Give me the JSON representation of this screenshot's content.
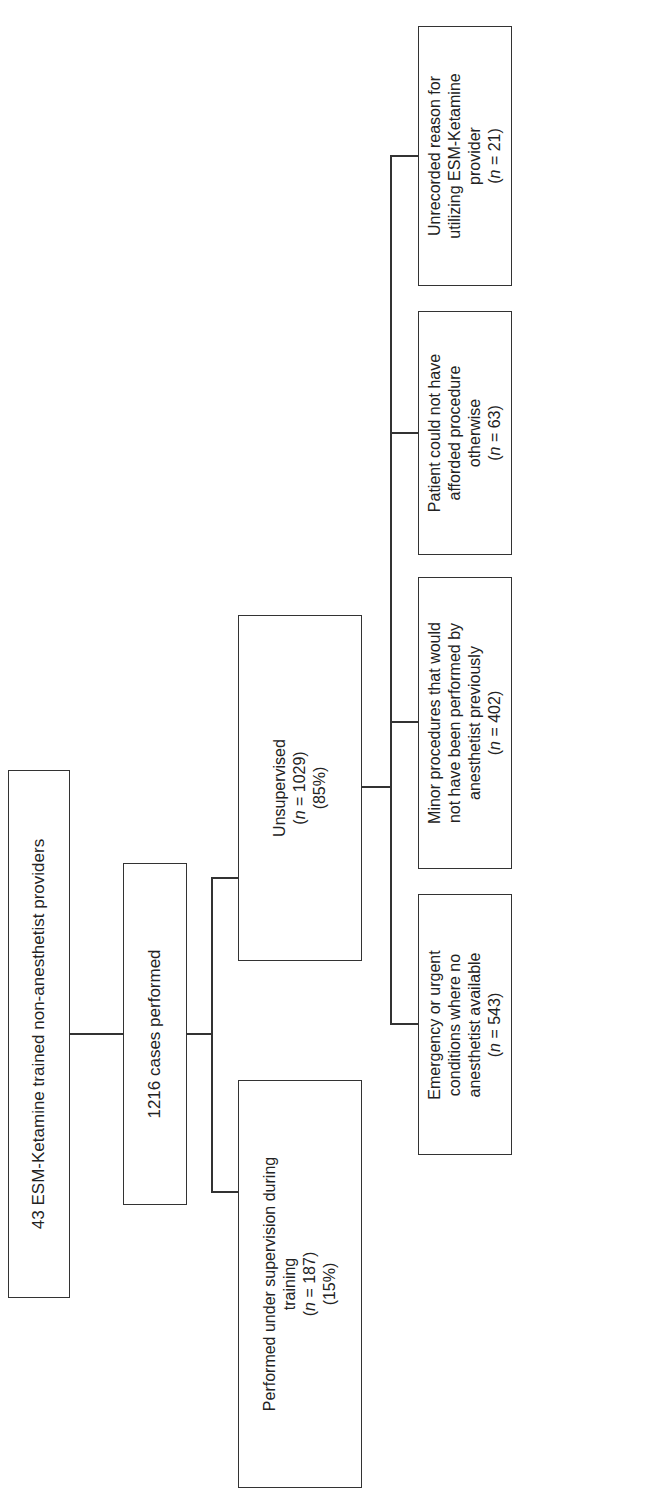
{
  "diagram": {
    "type": "flowchart",
    "orientation": "rotated-90-ccw",
    "root": {
      "label": "43 ESM-Ketamine trained non-anesthetist providers"
    },
    "cases": {
      "label": "1216 cases performed"
    },
    "unsupervised": {
      "line1": "Unsupervised",
      "n_prefix": "n",
      "n_text": " = 1029)",
      "open_paren": "(",
      "pct": "(85%)"
    },
    "supervised": {
      "line1": "Performed under supervision during",
      "line2": "training",
      "open_paren": "(",
      "n_prefix": "n",
      "n_text": " = 187)",
      "pct": "(15%)"
    },
    "reasons": [
      {
        "lines": [
          "Emergency or urgent",
          "conditions where no",
          "anesthetist available"
        ],
        "open_paren": "(",
        "n_prefix": "n",
        "n_text": " = 543)"
      },
      {
        "lines": [
          "Minor procedures that would",
          "not have been performed by",
          "anesthetist previously"
        ],
        "open_paren": "(",
        "n_prefix": "n",
        "n_text": " = 402)"
      },
      {
        "lines": [
          "Patient could not have",
          "afforded procedure",
          "otherwise"
        ],
        "open_paren": "(",
        "n_prefix": "n",
        "n_text": " = 63)"
      },
      {
        "lines": [
          "Unrecorded reason for",
          "utilizing ESM-Ketamine",
          "provider"
        ],
        "open_paren": "(",
        "n_prefix": "n",
        "n_text": " = 21)"
      }
    ]
  }
}
